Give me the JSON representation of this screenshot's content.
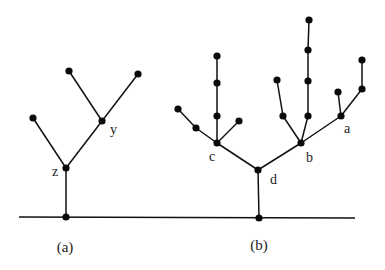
{
  "figure": {
    "baseline": {
      "x1": 19,
      "y1": 217,
      "x2": 355,
      "y2": 218
    },
    "captions": [
      {
        "id": "cap-a",
        "text": "(a)",
        "x": 65,
        "y": 252
      },
      {
        "id": "cap-b",
        "text": "(b)",
        "x": 259,
        "y": 250
      }
    ],
    "trees": [
      {
        "id": "a",
        "nodes": [
          {
            "id": "ra",
            "x": 66,
            "y": 217
          },
          {
            "id": "z",
            "x": 66,
            "y": 168,
            "label": "z",
            "lx": 52,
            "ly": 176
          },
          {
            "id": "a1",
            "x": 33,
            "y": 118
          },
          {
            "id": "y",
            "x": 102,
            "y": 121,
            "label": "y",
            "lx": 110,
            "ly": 134
          },
          {
            "id": "a2",
            "x": 69,
            "y": 71
          },
          {
            "id": "a3",
            "x": 138,
            "y": 74
          }
        ],
        "edges": [
          [
            "ra",
            "z"
          ],
          [
            "z",
            "a1"
          ],
          [
            "z",
            "y"
          ],
          [
            "y",
            "a2"
          ],
          [
            "y",
            "a3"
          ]
        ]
      },
      {
        "id": "b",
        "nodes": [
          {
            "id": "rb",
            "x": 259,
            "y": 218
          },
          {
            "id": "d",
            "x": 258,
            "y": 170,
            "label": "d",
            "lx": 270,
            "ly": 184
          },
          {
            "id": "c",
            "x": 217,
            "y": 143,
            "label": "c",
            "lx": 209,
            "ly": 161
          },
          {
            "id": "c1",
            "x": 196,
            "y": 128
          },
          {
            "id": "c2",
            "x": 178,
            "y": 109
          },
          {
            "id": "c3",
            "x": 217,
            "y": 116
          },
          {
            "id": "c4",
            "x": 217,
            "y": 83
          },
          {
            "id": "c5",
            "x": 217,
            "y": 56
          },
          {
            "id": "c6",
            "x": 239,
            "y": 121
          },
          {
            "id": "b",
            "x": 301,
            "y": 143,
            "label": "b",
            "lx": 306,
            "ly": 162
          },
          {
            "id": "b1",
            "x": 283,
            "y": 116
          },
          {
            "id": "b2",
            "x": 277,
            "y": 80
          },
          {
            "id": "b3",
            "x": 308,
            "y": 116
          },
          {
            "id": "b4",
            "x": 308,
            "y": 81
          },
          {
            "id": "b5",
            "x": 308,
            "y": 50
          },
          {
            "id": "b6",
            "x": 309,
            "y": 20
          },
          {
            "id": "a",
            "x": 341,
            "y": 116,
            "label": "a",
            "lx": 344,
            "ly": 133
          },
          {
            "id": "a1",
            "x": 338,
            "y": 92
          },
          {
            "id": "a2",
            "x": 362,
            "y": 89
          },
          {
            "id": "a3",
            "x": 362,
            "y": 60
          }
        ],
        "edges": [
          [
            "rb",
            "d"
          ],
          [
            "d",
            "c"
          ],
          [
            "d",
            "b"
          ],
          [
            "c",
            "c1"
          ],
          [
            "c1",
            "c2"
          ],
          [
            "c",
            "c3"
          ],
          [
            "c3",
            "c4"
          ],
          [
            "c4",
            "c5"
          ],
          [
            "c",
            "c6"
          ],
          [
            "b",
            "b1"
          ],
          [
            "b1",
            "b2"
          ],
          [
            "b",
            "b3"
          ],
          [
            "b3",
            "b4"
          ],
          [
            "b4",
            "b5"
          ],
          [
            "b5",
            "b6"
          ],
          [
            "b",
            "a"
          ],
          [
            "a",
            "a1"
          ],
          [
            "a",
            "a2"
          ],
          [
            "a2",
            "a3"
          ]
        ]
      }
    ]
  }
}
